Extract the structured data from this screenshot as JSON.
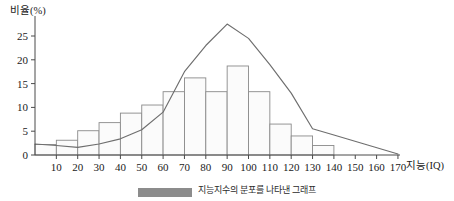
{
  "chart_data": {
    "type": "bar",
    "title": "",
    "xlabel": "지능(IQ)",
    "ylabel": "비율(%)",
    "xlim": [
      0,
      175
    ],
    "ylim": [
      0,
      28
    ],
    "grid": false,
    "legend_position": "bottom",
    "x_ticks": [
      10,
      20,
      30,
      40,
      50,
      60,
      70,
      80,
      90,
      100,
      110,
      120,
      130,
      140,
      150,
      160,
      170
    ],
    "y_ticks": [
      0,
      5,
      10,
      15,
      20,
      25
    ],
    "categories": [
      "0-10",
      "10-20",
      "20-30",
      "30-40",
      "40-50",
      "50-60",
      "60-70",
      "70-80",
      "80-90",
      "90-100",
      "100-110",
      "110-120",
      "120-130",
      "130-140"
    ],
    "bar_edges": [
      0,
      10,
      20,
      30,
      40,
      50,
      60,
      70,
      80,
      90,
      100,
      110,
      120,
      130,
      140
    ],
    "values": [
      2.2,
      3.1,
      5.1,
      6.8,
      8.8,
      10.5,
      13.3,
      16.2,
      13.3,
      18.7,
      13.3,
      6.5,
      4.0,
      2.0
    ],
    "series": [
      {
        "name": "비율(%) 분포 곡선",
        "type": "line",
        "x": [
          0,
          10,
          20,
          30,
          40,
          50,
          60,
          70,
          80,
          90,
          100,
          110,
          120,
          130,
          140,
          170
        ],
        "values": [
          2.3,
          2.0,
          1.6,
          2.3,
          3.4,
          5.3,
          9.0,
          17.5,
          23.0,
          27.5,
          24.5,
          19.0,
          13.0,
          5.5,
          4.2,
          0.2
        ]
      }
    ]
  },
  "axes": {
    "y_title": "비율(%)",
    "x_title": "지능(IQ)",
    "y_tick_labels": [
      "0",
      "5",
      "10",
      "15",
      "20",
      "25"
    ],
    "x_tick_labels": [
      "10",
      "20",
      "30",
      "40",
      "50",
      "60",
      "70",
      "80",
      "90",
      "100",
      "110",
      "120",
      "130",
      "140",
      "150",
      "160",
      "170"
    ]
  },
  "caption": {
    "swatch_label": "",
    "text": "지능지수의 분포를 나타낸 그래프"
  },
  "colors": {
    "bar_fill": "#fbfbfb",
    "bar_stroke": "#8a8a8a",
    "line": "#6e6e6e",
    "axis": "#4a4a4a",
    "caption_swatch": "#8c8c8c"
  }
}
